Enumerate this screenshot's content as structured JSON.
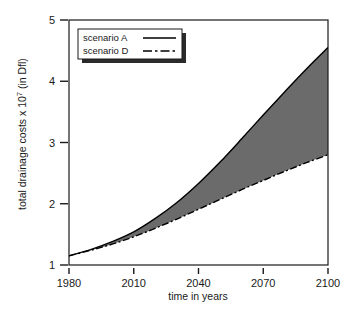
{
  "chart_data": {
    "type": "area",
    "title": "",
    "xlabel": "time in years",
    "ylabel": "total drainage costs x 10",
    "ylabel_exponent": "7",
    "ylabel_suffix": " (in Dfl)",
    "xlim": [
      1980,
      2100
    ],
    "ylim": [
      1,
      5
    ],
    "xticks": [
      1980,
      2010,
      2040,
      2070,
      2100
    ],
    "xtick_labels": [
      "1980",
      "2010",
      "2040",
      "2070",
      "2100"
    ],
    "yticks": [
      1,
      2,
      3,
      4,
      5
    ],
    "ytick_labels": [
      "1",
      "2",
      "3",
      "4",
      "5"
    ],
    "grid": false,
    "legend_position": "upper-left-inside",
    "fill_between_color": "#6b6b6b",
    "fill_between_label": "range between scenario A and scenario D",
    "x": [
      1980,
      1990,
      2000,
      2010,
      2020,
      2030,
      2040,
      2050,
      2060,
      2070,
      2080,
      2090,
      2100
    ],
    "series": [
      {
        "name": "scenario A",
        "style": "solid",
        "color": "#000000",
        "values": [
          1.15,
          1.25,
          1.38,
          1.54,
          1.76,
          2.02,
          2.33,
          2.68,
          3.06,
          3.45,
          3.83,
          4.2,
          4.55
        ]
      },
      {
        "name": "scenario D",
        "style": "dash-dot",
        "color": "#000000",
        "values": [
          1.15,
          1.24,
          1.34,
          1.46,
          1.6,
          1.75,
          1.91,
          2.07,
          2.23,
          2.38,
          2.53,
          2.67,
          2.8
        ]
      }
    ],
    "legend": [
      {
        "label": "scenario A",
        "style": "solid"
      },
      {
        "label": "scenario D",
        "style": "dash-dot"
      }
    ]
  }
}
